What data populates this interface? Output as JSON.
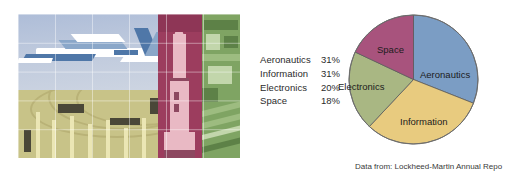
{
  "figure": {
    "caption": "Data from: Lockheed-Martin Annual Repo"
  },
  "legend": {
    "rows": [
      {
        "label": "Aeronautics",
        "percent": "31%"
      },
      {
        "label": "Information",
        "percent": "31%"
      },
      {
        "label": "Electronics",
        "percent": "20%"
      },
      {
        "label": "Space",
        "percent": "18%"
      }
    ]
  },
  "collage": {
    "panels": [
      {
        "name": "aeronautics-photo",
        "subject": "fighter-jet-in-sky",
        "tint": "#aebdd8"
      },
      {
        "name": "electronics-photo",
        "subject": "circuit-boards-and-wiring",
        "tint": "#d9d49a"
      },
      {
        "name": "space-photo",
        "subject": "rocket-on-launch-pad",
        "tint": "#9c3d5e"
      },
      {
        "name": "information-photo",
        "subject": "aerial-view-of-city",
        "tint": "#7fa463"
      }
    ]
  },
  "chart_data": {
    "type": "pie",
    "title": "",
    "categories": [
      "Aeronautics",
      "Information",
      "Electronics",
      "Space"
    ],
    "values": [
      31,
      31,
      20,
      18
    ],
    "unit": "%",
    "colors": [
      "#7b9dc4",
      "#e8cb7f",
      "#a9b783",
      "#a8537d"
    ],
    "start_angle_deg": 0,
    "direction": "clockwise",
    "legend": "left-of-chart",
    "labels_inside": true,
    "annotations": [
      "Data from: Lockheed-Martin Annual Repo"
    ]
  }
}
